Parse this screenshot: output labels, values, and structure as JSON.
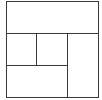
{
  "diagram": {
    "type": "rectangle-partition",
    "stroke_color": "#3a3a3a",
    "background": "#ffffff",
    "outer": {
      "x": 6,
      "y": 1,
      "w": 92,
      "h": 96
    },
    "regions": [
      {
        "name": "top-band",
        "x": 6,
        "y": 1,
        "w": 92,
        "h": 32
      },
      {
        "name": "middle-left-square",
        "x": 6,
        "y": 33,
        "w": 30,
        "h": 32
      },
      {
        "name": "middle-center-square",
        "x": 36,
        "y": 33,
        "w": 31,
        "h": 32
      },
      {
        "name": "right-column",
        "x": 67,
        "y": 33,
        "w": 31,
        "h": 64
      },
      {
        "name": "bottom-left-band",
        "x": 6,
        "y": 65,
        "w": 61,
        "h": 32
      }
    ]
  }
}
